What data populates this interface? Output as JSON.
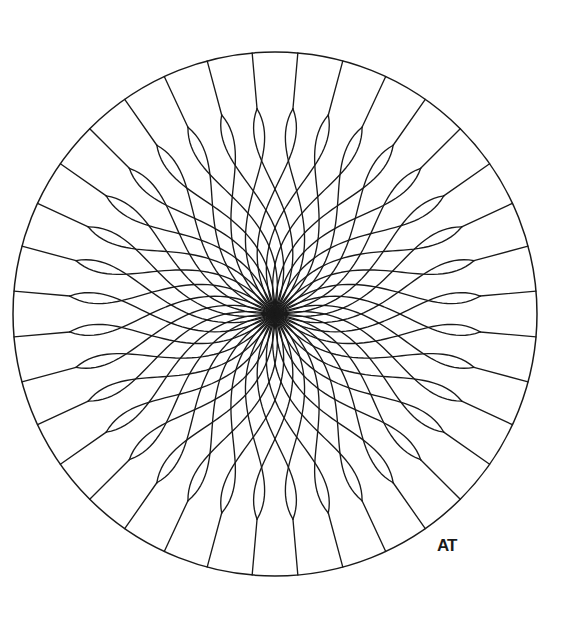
{
  "page": {
    "background_color": "#ffffff",
    "ink_color": "#1a1a1a",
    "width": 576,
    "height": 622
  },
  "artwork": {
    "type": "line-drawing",
    "subject": "radial lotus / dahlia mandala",
    "style": "black ink outline on white, uncolored coloring-book page",
    "signature": "AT",
    "signature_position": {
      "x": 437,
      "y": 551
    }
  },
  "geometry": {
    "center": {
      "x": 275,
      "y": 314
    },
    "outer_circle_radius": 262,
    "petal_tip_ring_radius": 206,
    "spoke_count": 36,
    "petal_count": 36,
    "petal_pairs": 36,
    "rotation_offset_degrees": 5,
    "petal_twist_degrees": 34,
    "petal_bulge": 0.42,
    "stroke_width": 1.35,
    "rim_stroke_width": 1.5
  },
  "chart_data": {
    "type": "line",
    "xlabel": "",
    "ylabel": "",
    "categories": [
      "outer circle",
      "radial spokes",
      "petal tip ring nodes",
      "clockwise petal arcs",
      "counter-clockwise petal arcs"
    ],
    "values": [
      1,
      36,
      36,
      36,
      36
    ],
    "legend": [
      "outline"
    ],
    "grid": false,
    "annotations": [
      "AT"
    ]
  },
  "colors": {
    "ink": "#1a1a1a",
    "paper": "#ffffff"
  }
}
